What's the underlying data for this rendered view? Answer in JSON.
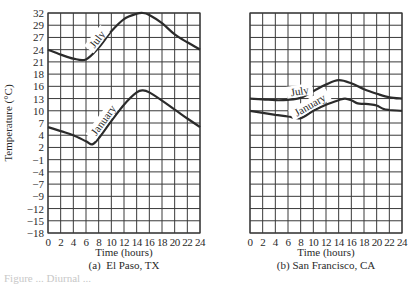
{
  "chart_data": [
    {
      "type": "line",
      "panel_label": "(a)  El Paso, TX",
      "title": "El Paso, TX",
      "xlabel": "Time (hours)",
      "ylabel": "Temperature (°C)",
      "xlim": [
        0,
        24
      ],
      "ylim": [
        -18,
        32
      ],
      "x_ticks": [
        0,
        2,
        4,
        6,
        8,
        10,
        12,
        14,
        16,
        18,
        20,
        22,
        24
      ],
      "y_ticks": [
        32,
        29,
        27,
        24,
        21,
        18,
        16,
        13,
        10,
        7,
        4,
        2,
        -1,
        -4,
        -7,
        -9,
        -12,
        -15,
        -18
      ],
      "y_ticks_shown": true,
      "grid": true,
      "legend": "inline curve labels",
      "series": [
        {
          "name": "July",
          "label_at_hour": 8.6,
          "x": [
            0,
            2,
            4,
            6,
            8,
            10,
            12,
            14,
            15,
            16,
            18,
            20,
            22,
            24
          ],
          "y": [
            24,
            22.8,
            21.8,
            21.6,
            24.5,
            28,
            30.5,
            31.8,
            32,
            31.5,
            29.5,
            27.5,
            25.8,
            24
          ]
        },
        {
          "name": "January",
          "label_at_hour": 9.6,
          "x": [
            0,
            2,
            4,
            6,
            7,
            8,
            10,
            12,
            14,
            15,
            16,
            18,
            20,
            22,
            24
          ],
          "y": [
            6,
            5,
            4,
            3,
            2.5,
            3.5,
            7.5,
            11.5,
            14.5,
            15,
            14.5,
            12.5,
            10.3,
            8.1,
            6
          ]
        }
      ]
    },
    {
      "type": "line",
      "panel_label": "(b) San Francisco, CA",
      "title": "San Francisco, CA",
      "xlabel": "Time (hours)",
      "ylabel": "",
      "xlim": [
        0,
        24
      ],
      "ylim": [
        -18,
        32
      ],
      "x_ticks": [
        0,
        2,
        4,
        6,
        8,
        10,
        12,
        14,
        16,
        18,
        20,
        22,
        24
      ],
      "y_ticks": [
        32,
        29,
        27,
        24,
        21,
        18,
        16,
        13,
        10,
        7,
        4,
        2,
        -1,
        -4,
        -7,
        -9,
        -12,
        -15,
        -18
      ],
      "y_ticks_shown": false,
      "grid": true,
      "legend": "inline curve labels",
      "series": [
        {
          "name": "July",
          "label_at_hour": 8.0,
          "x": [
            0,
            2,
            4,
            6,
            8,
            10,
            12,
            14,
            16,
            18,
            20,
            22,
            24
          ],
          "y": [
            13,
            12.8,
            12.6,
            12.7,
            13.2,
            14.8,
            16.3,
            17,
            16.5,
            15.3,
            14.2,
            13.3,
            13
          ]
        },
        {
          "name": "January",
          "label_at_hour": 10.0,
          "x": [
            0,
            2,
            4,
            6,
            8,
            10,
            12,
            14,
            15,
            16,
            17,
            18,
            19,
            20,
            21,
            22,
            24
          ],
          "y": [
            10,
            9.5,
            9,
            8.6,
            8.2,
            10,
            11.5,
            12.6,
            13,
            12.6,
            11.8,
            11.7,
            11.6,
            11.3,
            10.5,
            10.2,
            10
          ]
        }
      ]
    }
  ],
  "figure": {
    "panel_a_caption": "(a)  El Paso, TX",
    "panel_b_caption": "(b) San Francisco, CA",
    "x_axis_title": "Time (hours)",
    "y_axis_title": "Temperature (°C)",
    "faded_caption": "Figure ... Diurnal ..."
  },
  "style": {
    "line_color": "#2b2b2b",
    "grid_color": "#3a3a3a",
    "text_color": "#2a2a2a",
    "background": "#ffffff"
  }
}
